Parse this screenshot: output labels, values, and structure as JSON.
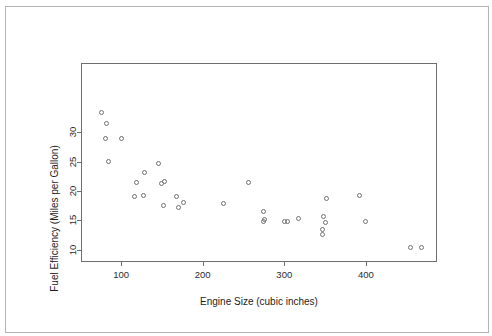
{
  "figure": {
    "border_color": "#b4b4b4",
    "background": "#ffffff",
    "axis_color": "#6e6e6e",
    "point_color": "#707070"
  },
  "chart_data": {
    "type": "scatter",
    "title": "",
    "xlabel": "Engine Size (cubic inches)",
    "ylabel": "Fuel Efficiency (Miles per Gallon)",
    "xticks": [
      100,
      200,
      300,
      400
    ],
    "yticks": [
      10,
      15,
      20,
      25,
      30
    ],
    "xtick_labels": [
      "100",
      "200",
      "300",
      "400"
    ],
    "ytick_labels": [
      "10",
      "15",
      "20",
      "25",
      "30"
    ],
    "xlim": [
      52,
      486
    ],
    "ylim": [
      8.1,
      41.6
    ],
    "grid": false,
    "legend": null,
    "marker": "open-circle",
    "points": [
      {
        "x": 76,
        "y": 33.4
      },
      {
        "x": 82,
        "y": 31.4
      },
      {
        "x": 81,
        "y": 28.9
      },
      {
        "x": 101,
        "y": 28.9
      },
      {
        "x": 84,
        "y": 25.1
      },
      {
        "x": 129,
        "y": 23.2
      },
      {
        "x": 153,
        "y": 21.6
      },
      {
        "x": 116,
        "y": 19.0
      },
      {
        "x": 150,
        "y": 21.3
      },
      {
        "x": 146,
        "y": 24.6
      },
      {
        "x": 119,
        "y": 21.4
      },
      {
        "x": 127,
        "y": 19.3
      },
      {
        "x": 168,
        "y": 19.0
      },
      {
        "x": 152,
        "y": 17.5
      },
      {
        "x": 176,
        "y": 18.0
      },
      {
        "x": 170,
        "y": 17.2
      },
      {
        "x": 256,
        "y": 21.4
      },
      {
        "x": 225,
        "y": 17.9
      },
      {
        "x": 275,
        "y": 16.6
      },
      {
        "x": 276,
        "y": 15.2
      },
      {
        "x": 275,
        "y": 14.8
      },
      {
        "x": 300,
        "y": 14.9
      },
      {
        "x": 304,
        "y": 14.9
      },
      {
        "x": 318,
        "y": 15.3
      },
      {
        "x": 348,
        "y": 15.7
      },
      {
        "x": 347,
        "y": 12.6
      },
      {
        "x": 352,
        "y": 18.7
      },
      {
        "x": 392,
        "y": 19.2
      },
      {
        "x": 351,
        "y": 14.6
      },
      {
        "x": 347,
        "y": 13.5
      },
      {
        "x": 400,
        "y": 14.8
      },
      {
        "x": 455,
        "y": 10.4
      },
      {
        "x": 468,
        "y": 10.4
      }
    ]
  }
}
